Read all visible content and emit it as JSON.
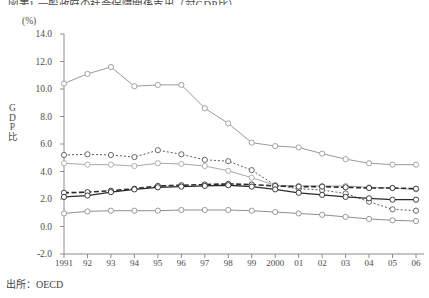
{
  "header": {
    "title": "図表1 一般政府の社会保障関係支出（対GDP比）",
    "unit_label": "(%)",
    "y_axis_title_chars": [
      "G",
      "D",
      "P",
      "比"
    ]
  },
  "source": {
    "label": "出所：OECD"
  },
  "chart_data": {
    "type": "line",
    "title": "",
    "xlabel": "",
    "ylabel": "GDP比",
    "unit": "%",
    "grid": false,
    "legend_position": "none",
    "ylim": [
      -2.0,
      14.0
    ],
    "ytick_labels": [
      "14.0",
      "12.0",
      "10.0",
      "8.0",
      "6.0",
      "4.0",
      "2.0",
      "0.0",
      "-2.0"
    ],
    "ytick_values": [
      14.0,
      12.0,
      10.0,
      8.0,
      6.0,
      4.0,
      2.0,
      0.0,
      -2.0
    ],
    "categories": [
      "1991",
      "92",
      "93",
      "94",
      "95",
      "96",
      "97",
      "98",
      "99",
      "2000",
      "01",
      "02",
      "03",
      "04",
      "05",
      "06"
    ],
    "x_values": [
      1991,
      1992,
      1993,
      1994,
      1995,
      1996,
      1997,
      1998,
      1999,
      2000,
      2001,
      2002,
      2003,
      2004,
      2005,
      2006
    ],
    "series": [
      {
        "name": "series-1",
        "style": "solid",
        "color": "#9a9a9a",
        "width": 1.0,
        "marker": "circle",
        "values": [
          10.4,
          11.1,
          11.6,
          10.2,
          10.3,
          10.3,
          8.6,
          7.5,
          6.1,
          5.85,
          5.75,
          5.3,
          4.9,
          4.6,
          4.5,
          4.5
        ]
      },
      {
        "name": "series-2",
        "style": "dotted",
        "color": "#5a5a5a",
        "width": 1.0,
        "marker": "circle",
        "values": [
          5.2,
          5.25,
          5.2,
          5.05,
          5.55,
          5.25,
          4.85,
          4.75,
          4.1,
          3.0,
          2.75,
          2.65,
          2.4,
          1.8,
          1.25,
          1.15
        ]
      },
      {
        "name": "series-3",
        "style": "solid",
        "color": "#a8a8a8",
        "width": 1.0,
        "marker": "circle",
        "values": [
          4.6,
          4.5,
          4.5,
          4.4,
          4.6,
          4.55,
          4.4,
          4.05,
          3.55,
          3.0,
          2.95,
          2.95,
          2.95,
          2.85,
          2.8,
          2.7
        ]
      },
      {
        "name": "series-4",
        "style": "dashed",
        "color": "#2b2b2b",
        "width": 1.6,
        "marker": "circle",
        "values": [
          2.45,
          2.5,
          2.6,
          2.75,
          2.95,
          3.0,
          3.05,
          3.1,
          3.05,
          2.95,
          2.9,
          2.9,
          2.85,
          2.8,
          2.8,
          2.75
        ]
      },
      {
        "name": "series-5",
        "style": "solid",
        "color": "#2b2b2b",
        "width": 1.3,
        "marker": "circle",
        "values": [
          2.15,
          2.25,
          2.5,
          2.7,
          2.85,
          2.9,
          2.95,
          3.0,
          2.9,
          2.7,
          2.45,
          2.3,
          2.15,
          2.05,
          1.95,
          1.95
        ]
      },
      {
        "name": "series-6",
        "style": "solid",
        "color": "#8f8f8f",
        "width": 1.0,
        "marker": "circle",
        "values": [
          0.95,
          1.1,
          1.15,
          1.15,
          1.15,
          1.2,
          1.2,
          1.2,
          1.15,
          1.05,
          0.95,
          0.85,
          0.7,
          0.55,
          0.45,
          0.4
        ]
      }
    ]
  }
}
